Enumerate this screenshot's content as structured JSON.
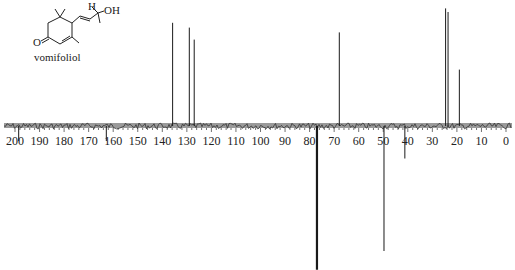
{
  "chart_data": {
    "type": "line",
    "compound_label": "vomifoliol",
    "structure_labels": {
      "hydrogen": "H",
      "hydroxyl": "OH",
      "carbonyl_oxygen": "O"
    },
    "xlabel": "",
    "ylabel": "",
    "x_reversed": true,
    "xlim": [
      205,
      0
    ],
    "x_ticks": [
      200,
      190,
      180,
      170,
      160,
      150,
      140,
      130,
      120,
      110,
      100,
      90,
      80,
      70,
      60,
      50,
      40,
      30,
      20,
      10,
      0
    ],
    "grid": false,
    "legend": null,
    "peaks": [
      {
        "ppm": 198.5,
        "intensity": -0.12,
        "phase": "negative"
      },
      {
        "ppm": 162.8,
        "intensity": -0.12,
        "phase": "negative"
      },
      {
        "ppm": 135.8,
        "intensity": 0.86,
        "phase": "positive"
      },
      {
        "ppm": 129.0,
        "intensity": 0.82,
        "phase": "positive"
      },
      {
        "ppm": 127.0,
        "intensity": 0.72,
        "phase": "positive"
      },
      {
        "ppm": 77.0,
        "intensity": -1.15,
        "phase": "negative",
        "note": "solvent"
      },
      {
        "ppm": 67.9,
        "intensity": 0.78,
        "phase": "positive"
      },
      {
        "ppm": 49.7,
        "intensity": -1.0,
        "phase": "negative"
      },
      {
        "ppm": 41.2,
        "intensity": -0.26,
        "phase": "negative"
      },
      {
        "ppm": 24.6,
        "intensity": 0.98,
        "phase": "positive"
      },
      {
        "ppm": 23.6,
        "intensity": 0.95,
        "phase": "positive"
      },
      {
        "ppm": 19.0,
        "intensity": 0.47,
        "phase": "positive"
      }
    ]
  },
  "colors": {
    "line": "#1a1a1a",
    "baseline": "#333333",
    "background": "#ffffff"
  }
}
